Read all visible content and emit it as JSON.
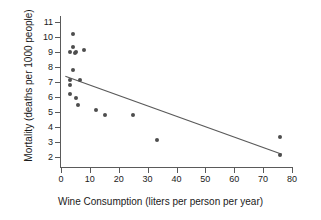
{
  "chart_data": {
    "type": "scatter",
    "title": "",
    "xlabel": "Wine Consumption (liters per person per year)",
    "ylabel": "Mortality (deaths per 1000 people)",
    "xlim": [
      0,
      80
    ],
    "ylim": [
      1.5,
      11.5
    ],
    "xticks": [
      0,
      10,
      20,
      30,
      40,
      50,
      60,
      70,
      80
    ],
    "yticks": [
      2,
      3,
      4,
      5,
      6,
      7,
      8,
      9,
      10,
      11
    ],
    "grid": false,
    "legend": null,
    "point_color": "#4d4d4d",
    "line_color": "#5a5a5a",
    "axis_color": "#5a5a5a",
    "points": [
      {
        "x": 4.0,
        "y": 10.2
      },
      {
        "x": 4.3,
        "y": 9.3
      },
      {
        "x": 3.1,
        "y": 9.0
      },
      {
        "x": 5.1,
        "y": 9.0
      },
      {
        "x": 7.9,
        "y": 9.1
      },
      {
        "x": 4.9,
        "y": 8.9
      },
      {
        "x": 4.2,
        "y": 7.8
      },
      {
        "x": 3.2,
        "y": 7.1
      },
      {
        "x": 3.2,
        "y": 6.8
      },
      {
        "x": 6.5,
        "y": 7.1
      },
      {
        "x": 3.1,
        "y": 6.2
      },
      {
        "x": 5.1,
        "y": 5.9
      },
      {
        "x": 5.8,
        "y": 5.45
      },
      {
        "x": 12.2,
        "y": 5.1
      },
      {
        "x": 15.1,
        "y": 4.75
      },
      {
        "x": 25.1,
        "y": 4.75
      },
      {
        "x": 33.1,
        "y": 3.1
      },
      {
        "x": 75.9,
        "y": 3.3
      },
      {
        "x": 75.9,
        "y": 2.1
      }
    ],
    "trend_line": {
      "x_start": 1.5,
      "y_start": 7.35,
      "x_end": 76.5,
      "y_end": 2.15
    }
  }
}
